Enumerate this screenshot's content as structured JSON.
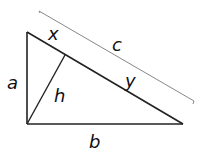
{
  "diagram": {
    "type": "right-triangle-altitude",
    "labels": {
      "a": "a",
      "b": "b",
      "c": "c",
      "x": "x",
      "y": "y",
      "h": "h"
    },
    "colors": {
      "line": "#222222",
      "bracket": "#888888",
      "text": "#111111"
    }
  }
}
